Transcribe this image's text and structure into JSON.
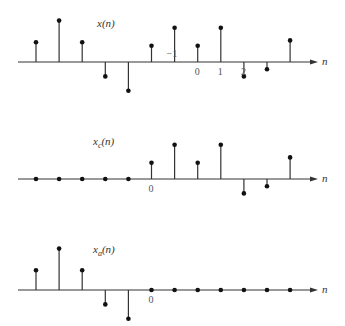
{
  "chart_data": [
    {
      "type": "stem",
      "title": "x(n)",
      "title_main": "x",
      "title_sub": "",
      "title_arg": "(n)",
      "axis_label": "n",
      "n": [
        -7,
        -6,
        -5,
        -4,
        -3,
        -2,
        -1,
        0,
        1,
        2,
        3,
        4
      ],
      "values": [
        0.55,
        1.15,
        0.55,
        -0.4,
        -0.8,
        0.45,
        0.95,
        0.45,
        0.95,
        -0.4,
        -0.2,
        0.6
      ],
      "tick_labels": [
        {
          "n": -1,
          "text": "−1",
          "above": true
        },
        {
          "n": 0,
          "text": "0"
        },
        {
          "n": 1,
          "text": "1"
        },
        {
          "n": 2,
          "text": "2"
        }
      ]
    },
    {
      "type": "stem",
      "title": "x_c(n)",
      "title_main": "x",
      "title_sub": "c",
      "title_arg": "(n)",
      "axis_label": "n",
      "n": [
        -5,
        -4,
        -3,
        -2,
        -1,
        0,
        1,
        2,
        3,
        4,
        5,
        6
      ],
      "values": [
        0,
        0,
        0,
        0,
        0,
        0.45,
        0.95,
        0.45,
        0.95,
        -0.4,
        -0.2,
        0.6
      ],
      "tick_labels": [
        {
          "n": 0,
          "text": "0"
        }
      ]
    },
    {
      "type": "stem",
      "title": "x_a(n)",
      "title_main": "x",
      "title_sub": "a",
      "title_arg": "(n)",
      "axis_label": "n",
      "n": [
        -5,
        -4,
        -3,
        -2,
        -1,
        0,
        1,
        2,
        3,
        4,
        5,
        6
      ],
      "values": [
        0.55,
        1.15,
        0.55,
        -0.4,
        -0.8,
        0,
        0,
        0,
        0,
        0,
        0,
        0
      ],
      "tick_labels": [
        {
          "n": 0,
          "text": "0"
        }
      ]
    }
  ]
}
